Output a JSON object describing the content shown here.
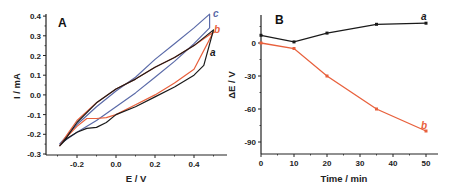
{
  "chart_data": [
    {
      "type": "line",
      "panel": "A",
      "title": "",
      "xlabel": "E / V",
      "ylabel": "I / mA",
      "xlim": [
        -0.35,
        0.55
      ],
      "ylim": [
        -0.3,
        0.4
      ],
      "x_ticks": [
        "-0.2",
        "0.0",
        "0.2",
        "0.4"
      ],
      "y_ticks": [
        "0.4",
        "0.3",
        "0.2",
        "0.1",
        "0.0",
        "-0.1",
        "-0.2",
        "-0.3"
      ],
      "grid": false,
      "legend": "inline curve labels at upper right",
      "series": [
        {
          "name": "a",
          "color": "#1a1a1a",
          "forward": {
            "x": [
              -0.29,
              -0.25,
              -0.2,
              -0.15,
              -0.1,
              -0.05,
              0.0,
              0.1,
              0.2,
              0.3,
              0.4,
              0.45,
              0.5
            ],
            "y": [
              -0.26,
              -0.22,
              -0.19,
              -0.17,
              -0.165,
              -0.14,
              -0.1,
              -0.06,
              -0.01,
              0.04,
              0.1,
              0.15,
              0.33
            ]
          },
          "reverse": {
            "x": [
              0.5,
              0.4,
              0.3,
              0.2,
              0.1,
              0.0,
              -0.1,
              -0.2,
              -0.25,
              -0.29
            ],
            "y": [
              0.33,
              0.25,
              0.19,
              0.14,
              0.08,
              0.03,
              -0.04,
              -0.14,
              -0.21,
              -0.26
            ]
          }
        },
        {
          "name": "b",
          "color": "#e8603c",
          "forward": {
            "x": [
              -0.29,
              -0.25,
              -0.2,
              -0.15,
              -0.1,
              -0.05,
              0.0,
              0.1,
              0.2,
              0.3,
              0.4,
              0.5
            ],
            "y": [
              -0.26,
              -0.21,
              -0.16,
              -0.12,
              -0.12,
              -0.115,
              -0.1,
              -0.05,
              0.0,
              0.06,
              0.13,
              0.32
            ]
          },
          "reverse": {
            "x": [
              0.5,
              0.4,
              0.3,
              0.2,
              0.1,
              0.0,
              -0.1,
              -0.2,
              -0.25,
              -0.29
            ],
            "y": [
              0.32,
              0.25,
              0.19,
              0.14,
              0.08,
              0.03,
              -0.04,
              -0.13,
              -0.2,
              -0.26
            ]
          }
        },
        {
          "name": "c",
          "color": "#5a6aa8",
          "forward": {
            "x": [
              -0.29,
              -0.2,
              -0.1,
              0.0,
              0.1,
              0.2,
              0.3,
              0.4,
              0.48
            ],
            "y": [
              -0.25,
              -0.19,
              -0.13,
              -0.06,
              0.01,
              0.09,
              0.17,
              0.26,
              0.34
            ]
          },
          "reverse": {
            "x": [
              0.48,
              0.4,
              0.3,
              0.2,
              0.1,
              0.0,
              -0.1,
              -0.2,
              -0.29
            ],
            "y": [
              0.41,
              0.34,
              0.26,
              0.18,
              0.09,
              0.02,
              -0.06,
              -0.15,
              -0.25
            ]
          }
        }
      ]
    },
    {
      "type": "line",
      "panel": "B",
      "title": "",
      "xlabel": "Time / min",
      "ylabel": "ΔE / V",
      "xlim": [
        0,
        54
      ],
      "ylim": [
        -100,
        23
      ],
      "x_ticks": [
        "0",
        "10",
        "20",
        "30",
        "40",
        "50"
      ],
      "y_ticks": [
        "0",
        "-30",
        "-60",
        "-90"
      ],
      "grid": false,
      "legend": "inline curve labels at right end",
      "categories": [
        0,
        10,
        20,
        35,
        50
      ],
      "series": [
        {
          "name": "a",
          "color": "#1a1a1a",
          "x": [
            0,
            10,
            20,
            35,
            50
          ],
          "values": [
            7,
            1,
            9,
            17,
            18
          ]
        },
        {
          "name": "b",
          "color": "#e8603c",
          "x": [
            0,
            10,
            20,
            35,
            50
          ],
          "values": [
            0,
            -5,
            -30,
            -60,
            -80
          ]
        }
      ]
    }
  ],
  "panelA": {
    "label": "A",
    "xlabel": "E / V",
    "ylabel": "I / mA",
    "xticks": [
      {
        "v": -0.2,
        "t": "-0.2"
      },
      {
        "v": 0.0,
        "t": "0.0"
      },
      {
        "v": 0.2,
        "t": "0.2"
      },
      {
        "v": 0.4,
        "t": "0.4"
      }
    ],
    "yticks": [
      {
        "v": 0.4,
        "t": "0.4"
      },
      {
        "v": 0.3,
        "t": "0.3"
      },
      {
        "v": 0.2,
        "t": "0.2"
      },
      {
        "v": 0.1,
        "t": "0.1"
      },
      {
        "v": 0.0,
        "t": "0.0"
      },
      {
        "v": -0.1,
        "t": "-0.1"
      },
      {
        "v": -0.2,
        "t": "-0.2"
      },
      {
        "v": -0.3,
        "t": "-0.3"
      }
    ],
    "curve_labels": {
      "a": "a",
      "b": "b",
      "c": "c"
    }
  },
  "panelB": {
    "label": "B",
    "xlabel": "Time / min",
    "ylabel": "ΔE / V",
    "xticks": [
      "0",
      "10",
      "20",
      "30",
      "40",
      "50"
    ],
    "yticks": [
      "0",
      "-30",
      "-60",
      "-90"
    ],
    "curve_labels": {
      "a": "a",
      "b": "b"
    }
  },
  "colors": {
    "a": "#1a1a1a",
    "b": "#e8603c",
    "c": "#5a6aa8",
    "axis": "#222222"
  }
}
